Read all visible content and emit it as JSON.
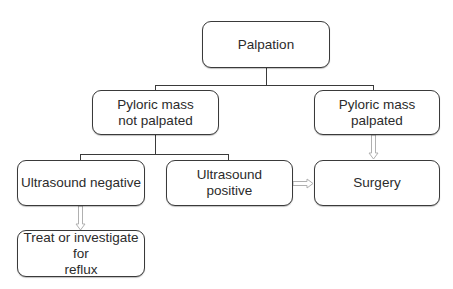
{
  "diagram": {
    "type": "flowchart",
    "nodes": [
      {
        "id": "palpation",
        "label": "Palpation"
      },
      {
        "id": "not_palpated",
        "label": "Pyloric mass\nnot palpated"
      },
      {
        "id": "palpated",
        "label": "Pyloric mass\npalpated"
      },
      {
        "id": "us_negative",
        "label": "Ultrasound negative"
      },
      {
        "id": "us_positive",
        "label": "Ultrasound\npositive"
      },
      {
        "id": "surgery",
        "label": "Surgery"
      },
      {
        "id": "treat",
        "label": "Treat or investigate for\nreflux"
      }
    ],
    "edges": [
      {
        "from": "palpation",
        "to": "not_palpated",
        "style": "line"
      },
      {
        "from": "palpation",
        "to": "palpated",
        "style": "line"
      },
      {
        "from": "not_palpated",
        "to": "us_negative",
        "style": "line"
      },
      {
        "from": "not_palpated",
        "to": "us_positive",
        "style": "line"
      },
      {
        "from": "palpated",
        "to": "surgery",
        "style": "arrow"
      },
      {
        "from": "us_positive",
        "to": "surgery",
        "style": "arrow"
      },
      {
        "from": "us_negative",
        "to": "treat",
        "style": "arrow"
      }
    ],
    "colors": {
      "border": "#3a3a3a",
      "arrow": "#b8b8b8",
      "text": "#2b2b2b"
    }
  }
}
